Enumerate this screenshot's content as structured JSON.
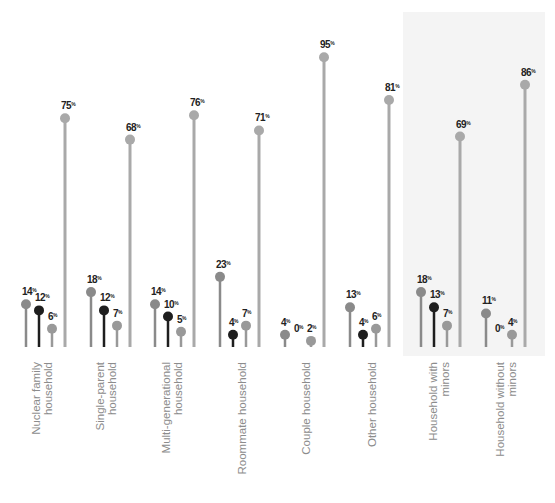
{
  "chart_data": {
    "type": "lollipop",
    "title": "",
    "xlabel": "",
    "ylabel": "",
    "ylim": [
      0,
      100
    ],
    "grid": false,
    "legend": null,
    "value_suffix": "%",
    "categories": [
      "Nuclear family household",
      "Single-parent household",
      "Multi-generational household",
      "Roommate household",
      "Couple household",
      "Other household",
      "Household with minors",
      "Household without minors"
    ],
    "series": [
      {
        "name": "series-1",
        "color": "#8a8a8a",
        "values": [
          14,
          18,
          14,
          23,
          4,
          13,
          18,
          11
        ]
      },
      {
        "name": "series-2",
        "color": "#1e1e1e",
        "values": [
          12,
          12,
          10,
          4,
          0,
          4,
          13,
          0
        ]
      },
      {
        "name": "series-3",
        "color": "#999999",
        "values": [
          6,
          7,
          5,
          7,
          2,
          6,
          7,
          4
        ]
      },
      {
        "name": "series-4",
        "color": "#a9a9a9",
        "values": [
          75,
          68,
          76,
          71,
          95,
          81,
          69,
          86
        ]
      }
    ],
    "highlighted_categories": [
      "Household with minors",
      "Household without minors"
    ]
  },
  "labels": {
    "cat0": "Nuclear family\nhousehold",
    "cat1": "Single-parent\nhousehold",
    "cat2": "Multi-generational\nhousehold",
    "cat3": "Roommate household",
    "cat4": "Couple household",
    "cat5": "Other household",
    "cat6": "Household with\nminors",
    "cat7": "Household without\nminors"
  }
}
